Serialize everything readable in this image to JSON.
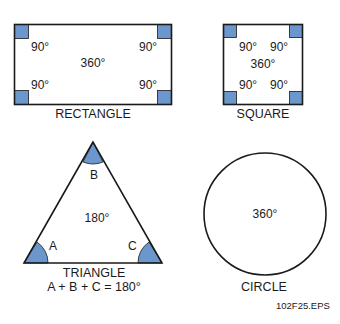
{
  "colors": {
    "fill": "#6b97cc",
    "stroke": "#1a1a1a"
  },
  "rectangle": {
    "caption": "RECTANGLE",
    "corner_angles": [
      "90°",
      "90°",
      "90°",
      "90°"
    ],
    "total": "360°"
  },
  "square": {
    "caption": "SQUARE",
    "corner_angles": [
      "90°",
      "90°",
      "90°",
      "90°"
    ],
    "total": "360°"
  },
  "triangle": {
    "caption": "TRIANGLE",
    "formula": "A + B + C = 180°",
    "vertices": [
      "A",
      "B",
      "C"
    ],
    "total": "180°"
  },
  "circle": {
    "caption": "CIRCLE",
    "total": "360°"
  },
  "figure_id": "102F25.EPS"
}
